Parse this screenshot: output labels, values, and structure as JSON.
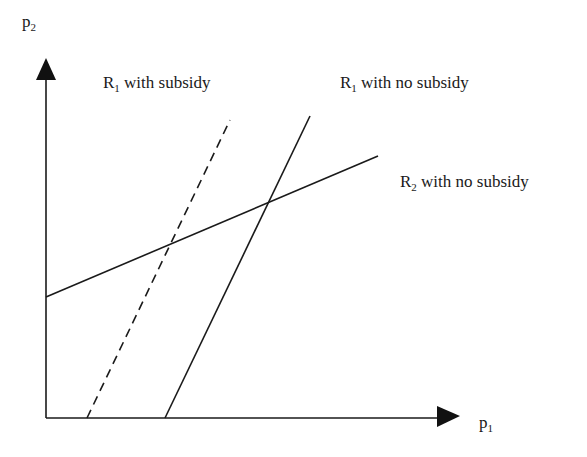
{
  "diagram": {
    "type": "reaction-functions",
    "x_axis": {
      "label": "p",
      "label_sub": "1"
    },
    "y_axis": {
      "label": "p",
      "label_sub": "2"
    },
    "lines": [
      {
        "id": "r1-subsidy",
        "label": "R",
        "label_sub": "1",
        "label_rest": " with subsidy",
        "style": "dashed",
        "color": "#1a1a1a"
      },
      {
        "id": "r1-no-subsidy",
        "label": "R",
        "label_sub": "1",
        "label_rest": " with no subsidy",
        "style": "solid",
        "color": "#1a1a1a"
      },
      {
        "id": "r2-no-subsidy",
        "label": "R",
        "label_sub": "2",
        "label_rest": " with no subsidy",
        "style": "solid",
        "color": "#1a1a1a"
      }
    ]
  }
}
